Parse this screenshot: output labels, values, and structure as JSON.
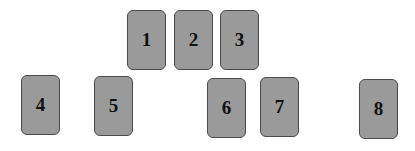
{
  "cards": [
    {
      "label": "1",
      "x": 127,
      "y": 10
    },
    {
      "label": "2",
      "x": 174,
      "y": 10
    },
    {
      "label": "3",
      "x": 220,
      "y": 10
    },
    {
      "label": "4",
      "x": 21,
      "y": 75
    },
    {
      "label": "5",
      "x": 94,
      "y": 76
    },
    {
      "label": "6",
      "x": 207,
      "y": 78
    },
    {
      "label": "7",
      "x": 260,
      "y": 77
    },
    {
      "label": "8",
      "x": 359,
      "y": 79
    }
  ],
  "colors": {
    "card_fill": "#9a9a9a",
    "card_border": "#4a4a4a",
    "text": "#111111"
  }
}
